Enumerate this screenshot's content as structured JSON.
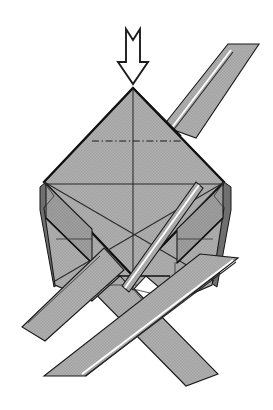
{
  "figure": {
    "kind": "origami-fold-diagram",
    "background_color": "#ffffff",
    "paper_fill_color": "#ababab",
    "paper_fill_color_shaded": "#9a9a9a",
    "outline_color": "#1a1a1a",
    "highlight_color": "#ffffff",
    "edge_shadow_color": "#6f6f6f"
  },
  "annotations": {
    "arrow": {
      "name": "fold-down-arrow",
      "direction": "down",
      "style": "hollow-outline-notched-tail",
      "tip_x": 133,
      "tip_y": 84,
      "tail_y": 29,
      "head_width": 30,
      "shaft_width": 13,
      "stroke": "#1c1c1c",
      "fill": "#ffffff"
    },
    "fold_line": {
      "name": "valley-fold-dash-dot-line",
      "style": "dash-dot",
      "x1": 92,
      "y1": 141,
      "x2": 181,
      "y2": 141,
      "stroke": "#1a1a1a"
    }
  },
  "geometry": {
    "center_diamond": {
      "name": "central-square-face",
      "apex_top": [
        133,
        88
      ],
      "apex_left": [
        46,
        183
      ],
      "apex_right": [
        224,
        183
      ],
      "apex_bottom": [
        133,
        276
      ]
    },
    "body_silhouette_points": "133,88 224,183 213,196 224,208 213,284 176,300 146,276 133,289 120,276 93,300 56,284 46,208 58,196 46,183",
    "strips": [
      {
        "name": "upper-right-strip",
        "points": "168,120 228,44 258,44 197,136"
      },
      {
        "name": "lower-left-strip",
        "points": "233,262 83,374 43,374 198,258"
      },
      {
        "name": "lower-right-strip-behind",
        "points": "88,252 216,376 184,385 58,265"
      },
      {
        "name": "left-flap-strip",
        "points": "18,326 100,253 122,272 45,340"
      }
    ]
  },
  "creases": {
    "center_vertical_x": 133,
    "center_horizontal_y": 184,
    "diagonal_from_top_left": [
      [
        46,
        183
      ],
      [
        224,
        284
      ]
    ],
    "diagonal_from_top_right": [
      [
        224,
        183
      ],
      [
        46,
        284
      ]
    ]
  },
  "legend": {
    "arrow_meaning": "fold-down",
    "dash_dot_meaning": "valley-fold-line",
    "solid_meaning": "paper-edge"
  }
}
